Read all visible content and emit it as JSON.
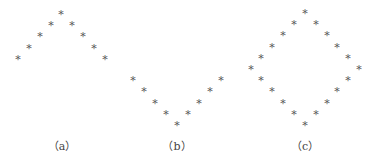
{
  "figure": {
    "star_glyph": "*",
    "star_color": "#555555",
    "panels": [
      {
        "id": "a",
        "label": "（a）",
        "label_x": 62,
        "shape": "inverted-V (peak at top)",
        "points": [
          [
            18,
            60
          ],
          [
            29,
            49
          ],
          [
            40,
            37
          ],
          [
            51,
            26
          ],
          [
            61,
            15
          ],
          [
            72,
            26
          ],
          [
            83,
            37
          ],
          [
            94,
            49
          ],
          [
            105,
            60
          ]
        ]
      },
      {
        "id": "b",
        "label": "（b）",
        "label_x": 177,
        "shape": "V (vertex at bottom)",
        "points": [
          [
            133,
            81
          ],
          [
            144,
            92
          ],
          [
            155,
            104
          ],
          [
            166,
            115
          ],
          [
            177,
            126
          ],
          [
            188,
            115
          ],
          [
            199,
            104
          ],
          [
            210,
            92
          ],
          [
            221,
            81
          ]
        ]
      },
      {
        "id": "c",
        "label": "（c）",
        "label_x": 305,
        "shape": "diamond",
        "points": [
          [
            305,
            14
          ],
          [
            294,
            25
          ],
          [
            283,
            36
          ],
          [
            272,
            48
          ],
          [
            261,
            59
          ],
          [
            251,
            70
          ],
          [
            261,
            81
          ],
          [
            272,
            92
          ],
          [
            283,
            104
          ],
          [
            294,
            115
          ],
          [
            305,
            126
          ],
          [
            316,
            115
          ],
          [
            327,
            104
          ],
          [
            337,
            92
          ],
          [
            348,
            81
          ],
          [
            359,
            70
          ],
          [
            348,
            59
          ],
          [
            337,
            48
          ],
          [
            327,
            36
          ],
          [
            316,
            25
          ]
        ]
      }
    ]
  }
}
